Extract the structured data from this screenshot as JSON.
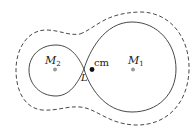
{
  "diagram": {
    "type": "roche-lobe-equipotentials",
    "colors": {
      "line": "#333333",
      "mass_dot": "#999999",
      "cm_dot": "#111111",
      "background": "#ffffff"
    },
    "curves": [
      {
        "name": "inner-critical-equipotential",
        "style": "solid",
        "shape": "figure-eight"
      },
      {
        "name": "outer-equipotential",
        "style": "dashed",
        "shape": "peanut"
      }
    ],
    "points": [
      {
        "id": "m2",
        "label": "M",
        "subscript": "2",
        "x": 55,
        "y": 69
      },
      {
        "id": "cm",
        "label": "cm",
        "x": 92,
        "y": 69
      },
      {
        "id": "m1",
        "label": "M",
        "subscript": "1",
        "x": 133,
        "y": 69
      },
      {
        "id": "L",
        "label": "L",
        "x": 84,
        "y": 69
      }
    ]
  },
  "labels": {
    "m2_main": "M",
    "m2_sub": "2",
    "m1_main": "M",
    "m1_sub": "1",
    "cm": "cm",
    "lagrange": "L"
  }
}
